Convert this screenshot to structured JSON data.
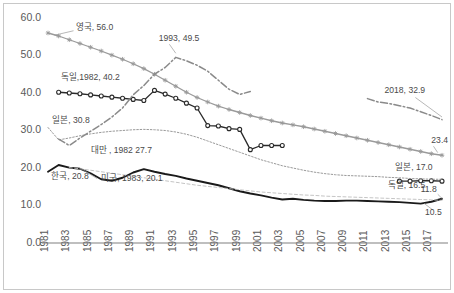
{
  "chart_data": {
    "type": "line",
    "title": "",
    "subtitle": "",
    "xlabel": "",
    "ylabel": "",
    "xlim": [
      1981,
      2018
    ],
    "ylim": [
      0.0,
      60.0
    ],
    "grid": false,
    "legend_position": "inline-annotations",
    "ytick_labels": [
      "60.0",
      "50.0",
      "40.0",
      "30.0",
      "20.0",
      "10.0",
      "0.0"
    ],
    "ytick_values": [
      60.0,
      50.0,
      40.0,
      30.0,
      20.0,
      10.0,
      0.0
    ],
    "xtick_labels": [
      "1981",
      "1983",
      "1985",
      "1987",
      "1989",
      "1991",
      "1993",
      "1995",
      "1997",
      "1999",
      "2001",
      "2003",
      "2005",
      "2007",
      "2009",
      "2011",
      "2013",
      "2015",
      "2017"
    ],
    "xtick_values": [
      1981,
      1983,
      1985,
      1987,
      1989,
      1991,
      1993,
      1995,
      1997,
      1999,
      2001,
      2003,
      2005,
      2007,
      2009,
      2011,
      2013,
      2015,
      2017
    ],
    "series": [
      {
        "name": "영국",
        "color": "#9a9a9a",
        "style": "solid-marker",
        "marker": "star",
        "x": [
          1981,
          1982,
          1983,
          1984,
          1985,
          1986,
          1987,
          1988,
          1989,
          1990,
          1991,
          1992,
          1993,
          1994,
          1995,
          1996,
          1997,
          1998,
          1999,
          2000,
          2001,
          2002,
          2003,
          2004,
          2005,
          2006,
          2007,
          2008,
          2009,
          2010,
          2011,
          2012,
          2013,
          2014,
          2015,
          2016,
          2017,
          2018
        ],
        "values": [
          56.0,
          55.2,
          54.2,
          53.2,
          52.2,
          51.2,
          50.1,
          49.0,
          47.8,
          46.5,
          45.0,
          43.4,
          41.8,
          40.2,
          38.8,
          37.6,
          36.5,
          35.6,
          34.8,
          34.0,
          33.3,
          32.6,
          32.0,
          31.5,
          31.0,
          30.4,
          29.8,
          29.2,
          28.6,
          28.0,
          27.4,
          26.8,
          26.2,
          25.6,
          25.0,
          24.4,
          23.8,
          23.4
        ]
      },
      {
        "name": "독일",
        "color": "#2a2a2a",
        "style": "solid-marker",
        "marker": "circle",
        "x": [
          1982,
          1983,
          1984,
          1985,
          1986,
          1987,
          1988,
          1989,
          1990,
          1991,
          1992,
          1993,
          1994,
          1995,
          1996,
          1997,
          1998,
          1999,
          2000,
          2001,
          2002,
          2003,
          2014,
          2015,
          2016,
          2017,
          2018
        ],
        "values": [
          40.2,
          40.0,
          39.8,
          39.5,
          39.2,
          38.9,
          38.6,
          38.3,
          38.0,
          40.7,
          39.7,
          38.6,
          37.3,
          36.0,
          31.3,
          31.2,
          30.5,
          30.3,
          24.9,
          26.0,
          26.0,
          26.0,
          16.5,
          16.5,
          16.6,
          16.6,
          16.5
        ]
      },
      {
        "name": "일본",
        "color": "#9a9a9a",
        "style": "dotted",
        "marker": "none",
        "x": [
          1981,
          1982,
          1983,
          1984,
          1985,
          1986,
          1987,
          1988,
          1989,
          1990,
          1991,
          1992,
          1993,
          1994,
          1995,
          1996,
          1997,
          1998,
          1999,
          2000,
          2001,
          2002,
          2003,
          2004,
          2005,
          2006,
          2007,
          2008,
          2009,
          2010,
          2011,
          2012,
          2013,
          2014,
          2015,
          2016,
          2017,
          2018
        ],
        "values": [
          30.8,
          27.5,
          28.0,
          28.6,
          29.1,
          29.5,
          29.8,
          30.0,
          30.2,
          30.3,
          30.2,
          30.0,
          29.6,
          29.0,
          28.2,
          27.2,
          26.2,
          25.2,
          24.2,
          23.2,
          22.2,
          21.4,
          20.6,
          20.0,
          19.4,
          18.9,
          18.5,
          18.2,
          18.0,
          17.9,
          17.8,
          17.7,
          17.5,
          17.4,
          17.2,
          17.1,
          17.0,
          17.0
        ]
      },
      {
        "name": "대만",
        "color": "#8a8a8a",
        "style": "dash-dot",
        "marker": "none",
        "x": [
          1982,
          1983,
          1984,
          1985,
          1986,
          1987,
          1988,
          1989,
          1990,
          1991,
          1992,
          1993,
          1994,
          1995,
          1996,
          1997,
          1998,
          1999,
          2000,
          2011,
          2012,
          2013,
          2014,
          2015,
          2016,
          2017,
          2018
        ],
        "values": [
          27.7,
          26.0,
          28.0,
          29.8,
          31.6,
          33.6,
          36.0,
          39.5,
          42.0,
          45.0,
          46.8,
          49.5,
          48.6,
          47.4,
          45.8,
          43.4,
          41.0,
          39.6,
          40.4,
          38.5,
          37.6,
          37.2,
          36.6,
          36.0,
          35.0,
          34.0,
          32.9
        ]
      },
      {
        "name": "한국",
        "color": "#1a1a1a",
        "style": "solid-thick",
        "marker": "none",
        "x": [
          1981,
          1982,
          1983,
          1984,
          1985,
          1986,
          1987,
          1988,
          1989,
          1990,
          1991,
          1992,
          1993,
          1994,
          1995,
          1996,
          1997,
          1998,
          1999,
          2000,
          2001,
          2002,
          2003,
          2004,
          2005,
          2006,
          2007,
          2008,
          2009,
          2010,
          2011,
          2012,
          2013,
          2014,
          2015,
          2016,
          2017,
          2018
        ],
        "values": [
          19.0,
          20.8,
          20.1,
          19.8,
          18.6,
          17.0,
          16.6,
          17.4,
          18.8,
          19.7,
          19.0,
          18.4,
          17.9,
          17.2,
          16.6,
          16.0,
          15.4,
          14.6,
          13.8,
          13.2,
          12.7,
          12.1,
          11.6,
          11.8,
          11.5,
          11.3,
          11.2,
          11.2,
          11.3,
          11.3,
          11.2,
          11.1,
          11.0,
          10.9,
          10.7,
          10.5,
          11.0,
          11.8
        ]
      },
      {
        "name": "미국",
        "color": "#bdbdbd",
        "style": "dashed-thin",
        "marker": "none",
        "x": [
          1983,
          1984,
          1985,
          1986,
          1987,
          1988,
          1989,
          1990,
          1991,
          1992,
          1993,
          1994,
          1995,
          1996,
          1997,
          1998,
          1999,
          2000,
          2001,
          2002,
          2003,
          2004,
          2005,
          2006,
          2007,
          2008,
          2009,
          2010,
          2011,
          2012,
          2013,
          2014,
          2015,
          2016,
          2017,
          2018
        ],
        "values": [
          20.1,
          19.8,
          19.4,
          19.0,
          18.6,
          18.2,
          17.8,
          17.4,
          17.0,
          16.6,
          16.2,
          15.8,
          15.4,
          15.1,
          14.8,
          14.5,
          14.2,
          13.9,
          13.6,
          13.4,
          13.2,
          13.0,
          12.8,
          12.7,
          12.5,
          12.4,
          12.3,
          12.2,
          12.1,
          12.0,
          11.9,
          11.8,
          11.7,
          11.6,
          11.5,
          11.4
        ]
      }
    ],
    "annotations": [
      {
        "id": "uk-start",
        "text": "영국, 56.0",
        "x": 1983.6,
        "y": 56.9,
        "anchor": "start"
      },
      {
        "id": "germany-start",
        "text": "독일,1982, 40.2",
        "x": 1982.2,
        "y": 43.6,
        "anchor": "start"
      },
      {
        "id": "japan-start",
        "text": "일본, 30.8",
        "x": 1981.4,
        "y": 31.9,
        "anchor": "start"
      },
      {
        "id": "taiwan-start",
        "text": "대만 , 1982 27.7",
        "x": 1985.0,
        "y": 24.1,
        "anchor": "start"
      },
      {
        "id": "korea-start",
        "text": "한국, 20.8",
        "x": 1981.3,
        "y": 17.0,
        "anchor": "start"
      },
      {
        "id": "usa-start",
        "text": "미국, 1983, 20.1",
        "x": 1986.0,
        "y": 16.6,
        "anchor": "start"
      },
      {
        "id": "taiwan-peak",
        "text": "1993, 49.5",
        "x": 1991.4,
        "y": 53.9,
        "anchor": "start"
      },
      {
        "id": "taiwan-end",
        "text": "2018, 32.9",
        "x": 2012.6,
        "y": 39.9,
        "anchor": "start"
      },
      {
        "id": "uk-end",
        "text": "23.4",
        "x": 2017.0,
        "y": 26.6,
        "anchor": "start"
      },
      {
        "id": "japan-end",
        "text": "일본, 17.0",
        "x": 2013.6,
        "y": 19.6,
        "anchor": "start"
      },
      {
        "id": "germany-end",
        "text": "독일, 16.5",
        "x": 2012.9,
        "y": 14.6,
        "anchor": "start"
      },
      {
        "id": "korea-end-2018",
        "text": "11.8",
        "x": 2016.0,
        "y": 13.6,
        "anchor": "start"
      },
      {
        "id": "korea-min",
        "text": "10.5",
        "x": 2016.4,
        "y": 7.6,
        "anchor": "start"
      }
    ],
    "leaders": [
      {
        "id": "leader-uk-start",
        "x1": 1983.4,
        "y1": 56.6,
        "x2": 1981.6,
        "y2": 55.4
      },
      {
        "id": "leader-taiwan-peak",
        "x1": 1992.4,
        "y1": 53.0,
        "x2": 1993.0,
        "y2": 50.6
      },
      {
        "id": "leader-taiwan-end",
        "x1": 2015.5,
        "y1": 38.8,
        "x2": 2018.0,
        "y2": 33.6
      },
      {
        "id": "leader-usa-start",
        "x1": 1985.6,
        "y1": 17.2,
        "x2": 1984.3,
        "y2": 19.5
      },
      {
        "id": "leader-korea-min",
        "x1": 2017.1,
        "y1": 8.9,
        "x2": 2016.3,
        "y2": 10.6
      },
      {
        "id": "leader-korea-11-8",
        "x1": 2017.6,
        "y1": 13.0,
        "x2": 2018.1,
        "y2": 11.6
      },
      {
        "id": "leader-uk-end",
        "x1": 2017.2,
        "y1": 25.8,
        "x2": 2017.6,
        "y2": 24.1
      }
    ]
  }
}
